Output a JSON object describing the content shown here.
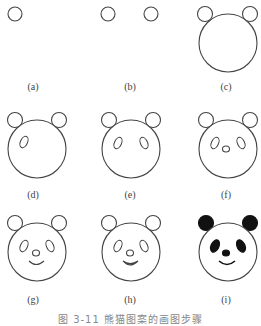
{
  "figure": {
    "caption": "图 3-11  熊猫图案的画图步骤",
    "stroke_color": "#444444",
    "fill_color": "#111111",
    "panels": [
      {
        "id": "a",
        "label": "(a)",
        "step": "one ear circle"
      },
      {
        "id": "b",
        "label": "(b)",
        "step": "two ear circles"
      },
      {
        "id": "c",
        "label": "(c)",
        "step": "face circle added"
      },
      {
        "id": "d",
        "label": "(d)",
        "step": "left eye"
      },
      {
        "id": "e",
        "label": "(e)",
        "step": "both eyes"
      },
      {
        "id": "f",
        "label": "(f)",
        "step": "nose"
      },
      {
        "id": "g",
        "label": "(g)",
        "step": "mouth"
      },
      {
        "id": "h",
        "label": "(h)",
        "step": "mouth thickened"
      },
      {
        "id": "i",
        "label": "(i)",
        "step": "filled panda"
      }
    ]
  }
}
